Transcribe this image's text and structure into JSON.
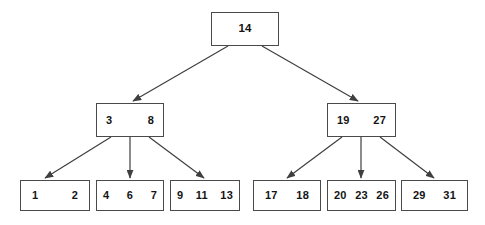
{
  "diagram": {
    "background_color": "#ffffff",
    "node_border_color": "#4a4a4a",
    "edge_color": "#3f3f3f",
    "text_color": "#141414"
  },
  "chart_data": {
    "type": "diagram",
    "subtype": "b-tree",
    "levels": 3,
    "nodes": [
      {
        "id": "root",
        "level": 0,
        "keys": [
          "14"
        ],
        "box": {
          "x": 211,
          "y": 12,
          "w": 68,
          "h": 34
        }
      },
      {
        "id": "internal-left",
        "level": 1,
        "keys": [
          "3",
          "8"
        ],
        "box": {
          "x": 96,
          "y": 103,
          "w": 68,
          "h": 34
        }
      },
      {
        "id": "internal-right",
        "level": 1,
        "keys": [
          "19",
          "27"
        ],
        "box": {
          "x": 327,
          "y": 103,
          "w": 69,
          "h": 34
        }
      },
      {
        "id": "leaf-1",
        "level": 2,
        "keys": [
          "1",
          "2"
        ],
        "box": {
          "x": 20,
          "y": 180,
          "w": 70,
          "h": 31
        }
      },
      {
        "id": "leaf-2",
        "level": 2,
        "keys": [
          "4",
          "6",
          "7"
        ],
        "box": {
          "x": 96,
          "y": 180,
          "w": 68,
          "h": 31
        }
      },
      {
        "id": "leaf-3",
        "level": 2,
        "keys": [
          "9",
          "11",
          "13"
        ],
        "box": {
          "x": 170,
          "y": 180,
          "w": 70,
          "h": 31
        }
      },
      {
        "id": "leaf-4",
        "level": 2,
        "keys": [
          "17",
          "18"
        ],
        "box": {
          "x": 253,
          "y": 180,
          "w": 68,
          "h": 31
        }
      },
      {
        "id": "leaf-5",
        "level": 2,
        "keys": [
          "20",
          "23",
          "26"
        ],
        "box": {
          "x": 327,
          "y": 180,
          "w": 69,
          "h": 31
        }
      },
      {
        "id": "leaf-6",
        "level": 2,
        "keys": [
          "29",
          "31"
        ],
        "box": {
          "x": 401,
          "y": 180,
          "w": 67,
          "h": 31
        }
      }
    ],
    "edges": [
      {
        "from": "root",
        "to": "internal-left",
        "x1": 228,
        "y1": 46,
        "x2": 133,
        "y2": 101
      },
      {
        "from": "root",
        "to": "internal-right",
        "x1": 262,
        "y1": 46,
        "x2": 358,
        "y2": 101
      },
      {
        "from": "internal-left",
        "to": "leaf-1",
        "x1": 111,
        "y1": 137,
        "x2": 45,
        "y2": 178
      },
      {
        "from": "internal-left",
        "to": "leaf-2",
        "x1": 130,
        "y1": 137,
        "x2": 130,
        "y2": 178
      },
      {
        "from": "internal-left",
        "to": "leaf-3",
        "x1": 149,
        "y1": 137,
        "x2": 204,
        "y2": 178
      },
      {
        "from": "internal-right",
        "to": "leaf-4",
        "x1": 342,
        "y1": 137,
        "x2": 287,
        "y2": 178
      },
      {
        "from": "internal-right",
        "to": "leaf-5",
        "x1": 361,
        "y1": 137,
        "x2": 361,
        "y2": 178
      },
      {
        "from": "internal-right",
        "to": "leaf-6",
        "x1": 380,
        "y1": 137,
        "x2": 434,
        "y2": 178
      }
    ]
  }
}
